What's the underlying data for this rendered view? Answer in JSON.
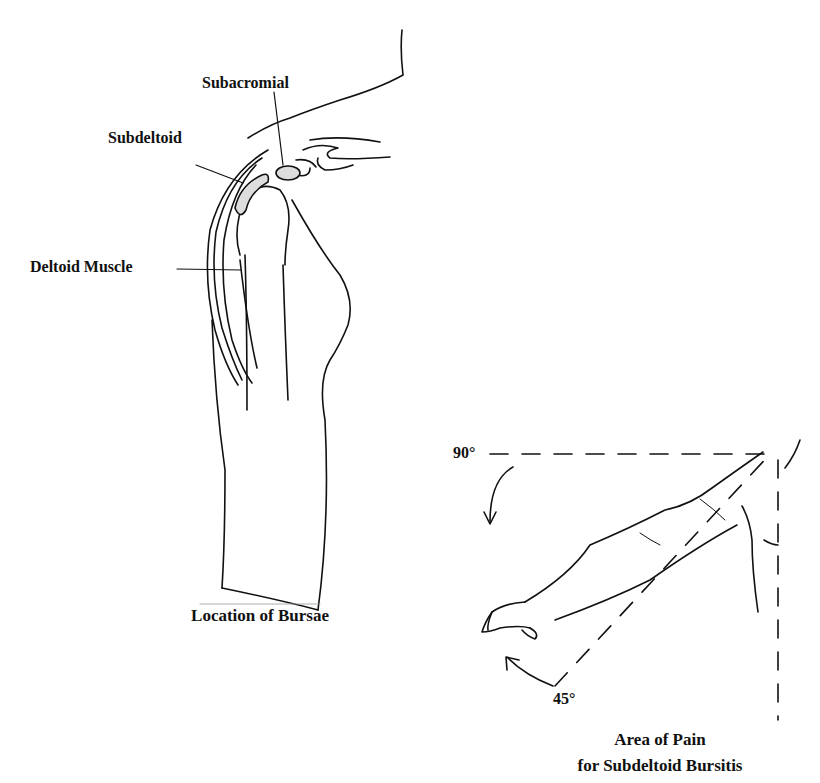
{
  "left_figure": {
    "labels": {
      "subacromial": "Subacromial",
      "subdeltoid": "Subdeltoid",
      "deltoid_muscle": "Deltoid Muscle"
    },
    "caption": "Location of Bursae"
  },
  "right_figure": {
    "angles": {
      "top": "90°",
      "bottom": "45°"
    },
    "caption_line1": "Area of Pain",
    "caption_line2": "for Subdeltoid Bursitis"
  }
}
